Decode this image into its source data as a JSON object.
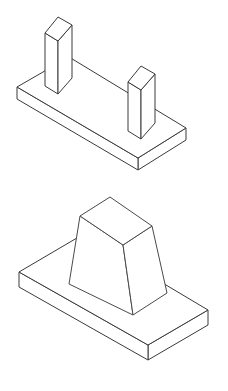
{
  "sheet": {
    "title": "Isometric Technical Drawing Sheet",
    "background_color": "#ffffff",
    "line_color": "#3a3a3c",
    "face_color": "#ffffff",
    "width": 228,
    "height": 391
  },
  "figures": [
    {
      "id": "figure-top",
      "name": "Base plate with two rectangular posts",
      "projection": "isometric",
      "parts": [
        {
          "name": "base-plate",
          "shape": "rectangular slab",
          "faces": {
            "top": "17,87 69,57 186,128 138,158",
            "front_left": "17,87 17,99 138,170 138,158",
            "front_right": "138,158 138,170 186,140 186,128"
          }
        },
        {
          "name": "post-left",
          "shape": "rectangular prism",
          "faces": {
            "top": "45,33 58,17 72,25 58,41",
            "left": "45,33 45,86 58,94 58,41",
            "right": "58,41 58,94 72,78 72,25"
          }
        },
        {
          "name": "post-right",
          "shape": "rectangular prism",
          "faces": {
            "top": "128,82 141,66 155,74 141,90",
            "left": "128,82 128,131 141,139 141,90",
            "right": "141,90 141,139 155,123 155,74"
          }
        }
      ]
    },
    {
      "id": "figure-bottom",
      "name": "Base plate with truncated pyramid boss",
      "projection": "isometric",
      "parts": [
        {
          "name": "base-plate",
          "shape": "rectangular slab",
          "faces": {
            "top": "19,272 82,235 208,310 148,345",
            "front_left": "19,272 19,287 148,360 148,345",
            "front_right": "148,345 148,360 208,325 208,310"
          }
        },
        {
          "name": "frustum-boss",
          "shape": "truncated pyramid",
          "faces": {
            "top": "80,216 110,197 152,226 123,245",
            "left": "80,216 123,245 133,315 69,284",
            "right": "123,245 152,226 167,293 133,315"
          }
        }
      ]
    }
  ]
}
